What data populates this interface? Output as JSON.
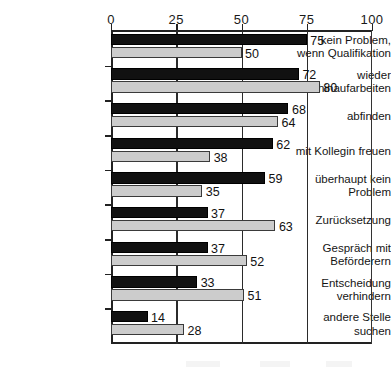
{
  "chart_data": {
    "type": "bar",
    "orientation": "horizontal",
    "title": "",
    "subtitle": "",
    "xlabel": "",
    "ylabel": "",
    "xlim": [
      0,
      100
    ],
    "xticks": [
      0,
      25,
      50,
      75,
      100
    ],
    "xtick_labels": [
      "0",
      "25",
      "50",
      "75",
      "100"
    ],
    "grid": "vertical gridlines at 25, 50, 75",
    "legend": "",
    "legend_position": "below-plot (cropped out of frame)",
    "categories": [
      "kein Problem,\nwenn Qualifikation",
      "wieder\nhinaufarbeiten",
      "abfinden",
      "mit Kollegin freuen",
      "überhaupt kein\nProblem",
      "Zurücksetzung",
      "Gespräch mit\nBeförderern",
      "Entscheidung\nverhindern",
      "andere Stelle\nsuchen"
    ],
    "series": [
      {
        "name": "series-black",
        "color": "#111111",
        "values": [
          75,
          72,
          68,
          62,
          59,
          37,
          37,
          33,
          14
        ]
      },
      {
        "name": "series-gray",
        "color": "#cccccc",
        "values": [
          50,
          80,
          64,
          38,
          35,
          63,
          52,
          51,
          28
        ]
      }
    ]
  }
}
